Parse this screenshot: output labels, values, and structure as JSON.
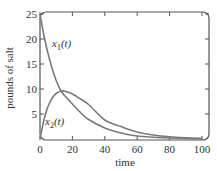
{
  "chart_data": {
    "type": "line",
    "title": "",
    "xlabel": "time",
    "ylabel": "pounds of salt",
    "xlim": [
      0,
      104
    ],
    "ylim": [
      0,
      25.5
    ],
    "grid": false,
    "legend": "none (inline curve labels)",
    "x_ticks": [
      0,
      20,
      40,
      60,
      80,
      100
    ],
    "y_ticks": [
      5,
      10,
      15,
      20,
      25
    ],
    "x_tick_labels": [
      "0",
      "20",
      "40",
      "60",
      "80",
      "100"
    ],
    "y_tick_labels": [
      "5",
      "10",
      "15",
      "20",
      "25"
    ],
    "x": [
      0,
      2,
      4,
      6,
      8,
      10,
      13,
      16,
      20,
      25,
      30,
      40,
      50,
      60,
      70,
      80,
      90,
      100
    ],
    "series": [
      {
        "name": "x1(t)",
        "label_main": "x",
        "label_sub": "1",
        "label_tail": "(t)",
        "color": "#7a7a7a",
        "values": [
          25,
          21.4,
          18.4,
          15.8,
          13.6,
          11.7,
          9.6,
          8.4,
          7.0,
          5.3,
          3.9,
          2.2,
          1.2,
          0.6,
          0.35,
          0.2,
          0.1,
          0.05
        ]
      },
      {
        "name": "x2(t)",
        "label_main": "x",
        "label_sub": "2",
        "label_tail": "(t)",
        "color": "#7a7a7a",
        "values": [
          0,
          3.2,
          5.6,
          7.3,
          8.4,
          9.1,
          9.6,
          9.5,
          9.0,
          8.0,
          6.9,
          3.8,
          2.5,
          1.4,
          0.8,
          0.45,
          0.25,
          0.12
        ]
      }
    ],
    "annotations": [
      {
        "text": "x1(t)",
        "near": {
          "x": 8,
          "y": 19.5
        }
      },
      {
        "text": "x2(t)",
        "near": {
          "x": 3,
          "y": 4
        }
      }
    ]
  }
}
